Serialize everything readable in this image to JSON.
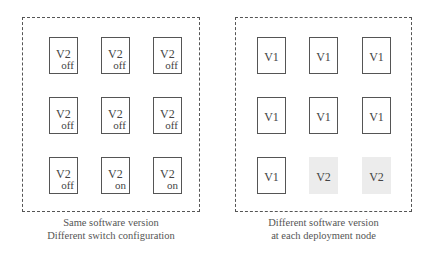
{
  "left_panel": {
    "caption_line1": "Same software version",
    "caption_line2": "Different switch configuration",
    "nodes": [
      {
        "version": "V2",
        "switch": "off"
      },
      {
        "version": "V2",
        "switch": "off"
      },
      {
        "version": "V2",
        "switch": "off"
      },
      {
        "version": "V2",
        "switch": "off"
      },
      {
        "version": "V2",
        "switch": "off"
      },
      {
        "version": "V2",
        "switch": "off"
      },
      {
        "version": "V2",
        "switch": "off"
      },
      {
        "version": "V2",
        "switch": "on"
      },
      {
        "version": "V2",
        "switch": "on"
      }
    ]
  },
  "right_panel": {
    "caption_line1": "Different software version",
    "caption_line2": "at each deployment node",
    "nodes": [
      {
        "version": "V1",
        "highlighted": false
      },
      {
        "version": "V1",
        "highlighted": false
      },
      {
        "version": "V1",
        "highlighted": false
      },
      {
        "version": "V1",
        "highlighted": false
      },
      {
        "version": "V1",
        "highlighted": false
      },
      {
        "version": "V1",
        "highlighted": false
      },
      {
        "version": "V1",
        "highlighted": false
      },
      {
        "version": "V2",
        "highlighted": true
      },
      {
        "version": "V2",
        "highlighted": true
      }
    ]
  },
  "colors": {
    "border": "#555555",
    "highlight_fill": "#ececec"
  }
}
